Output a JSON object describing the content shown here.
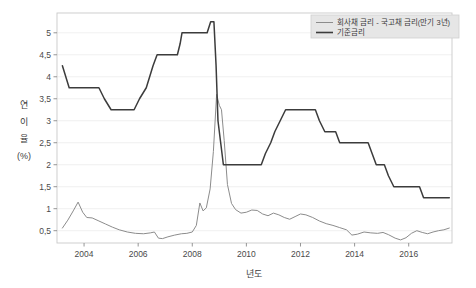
{
  "chart_data": {
    "type": "line",
    "title": "",
    "xlabel": "년도",
    "ylabel": "연 이율 (%)",
    "xlim": [
      2003.0,
      2017.6
    ],
    "ylim": [
      0.22,
      5.45
    ],
    "xticks": [
      2004,
      2006,
      2008,
      2010,
      2012,
      2014,
      2016
    ],
    "xtick_labels": [
      "2004",
      "2006",
      "2008",
      "2010",
      "2012",
      "2014",
      "2016"
    ],
    "yticks": [
      0.5,
      1,
      1.5,
      2,
      2.5,
      3,
      3.5,
      4,
      4.5,
      5
    ],
    "ytick_labels": [
      "0,5",
      "1",
      "1,5",
      "2",
      "2,5",
      "3",
      "3,5",
      "4",
      "4,5",
      "5"
    ],
    "grid": true,
    "legend_position": "upper right",
    "series": [
      {
        "name": "회사채 금리 - 국고채 금리(만기 3년)",
        "color": "#8c8c8c",
        "linewidth": 1.0,
        "points": [
          [
            2003.2,
            0.56
          ],
          [
            2003.4,
            0.74
          ],
          [
            2003.6,
            0.95
          ],
          [
            2003.78,
            1.15
          ],
          [
            2003.95,
            0.92
          ],
          [
            2004.1,
            0.8
          ],
          [
            2004.3,
            0.79
          ],
          [
            2004.55,
            0.72
          ],
          [
            2004.8,
            0.65
          ],
          [
            2005.05,
            0.58
          ],
          [
            2005.3,
            0.52
          ],
          [
            2005.6,
            0.47
          ],
          [
            2005.9,
            0.44
          ],
          [
            2006.2,
            0.43
          ],
          [
            2006.45,
            0.45
          ],
          [
            2006.6,
            0.47
          ],
          [
            2006.75,
            0.33
          ],
          [
            2006.9,
            0.32
          ],
          [
            2007.1,
            0.36
          ],
          [
            2007.35,
            0.4
          ],
          [
            2007.6,
            0.43
          ],
          [
            2007.8,
            0.44
          ],
          [
            2008.0,
            0.47
          ],
          [
            2008.15,
            0.62
          ],
          [
            2008.28,
            1.13
          ],
          [
            2008.4,
            0.95
          ],
          [
            2008.52,
            1.02
          ],
          [
            2008.66,
            1.45
          ],
          [
            2008.78,
            2.3
          ],
          [
            2008.9,
            3.6
          ],
          [
            2009.0,
            3.35
          ],
          [
            2009.08,
            3.25
          ],
          [
            2009.18,
            2.55
          ],
          [
            2009.3,
            1.55
          ],
          [
            2009.45,
            1.12
          ],
          [
            2009.6,
            0.98
          ],
          [
            2009.8,
            0.9
          ],
          [
            2010.0,
            0.92
          ],
          [
            2010.2,
            0.97
          ],
          [
            2010.4,
            0.96
          ],
          [
            2010.6,
            0.88
          ],
          [
            2010.8,
            0.84
          ],
          [
            2011.0,
            0.9
          ],
          [
            2011.2,
            0.86
          ],
          [
            2011.4,
            0.8
          ],
          [
            2011.6,
            0.76
          ],
          [
            2011.8,
            0.82
          ],
          [
            2012.0,
            0.88
          ],
          [
            2012.2,
            0.86
          ],
          [
            2012.45,
            0.8
          ],
          [
            2012.7,
            0.72
          ],
          [
            2012.95,
            0.66
          ],
          [
            2013.2,
            0.62
          ],
          [
            2013.45,
            0.57
          ],
          [
            2013.7,
            0.52
          ],
          [
            2013.9,
            0.4
          ],
          [
            2014.1,
            0.42
          ],
          [
            2014.35,
            0.47
          ],
          [
            2014.6,
            0.45
          ],
          [
            2014.85,
            0.44
          ],
          [
            2015.05,
            0.46
          ],
          [
            2015.25,
            0.41
          ],
          [
            2015.5,
            0.33
          ],
          [
            2015.7,
            0.29
          ],
          [
            2015.9,
            0.34
          ],
          [
            2016.1,
            0.44
          ],
          [
            2016.3,
            0.5
          ],
          [
            2016.5,
            0.46
          ],
          [
            2016.7,
            0.43
          ],
          [
            2016.9,
            0.47
          ],
          [
            2017.1,
            0.5
          ],
          [
            2017.3,
            0.52
          ],
          [
            2017.5,
            0.56
          ]
        ]
      },
      {
        "name": "기준금리",
        "color": "#3c3c3c",
        "linewidth": 1.5,
        "points": [
          [
            2003.2,
            4.25
          ],
          [
            2003.45,
            3.75
          ],
          [
            2004.55,
            3.75
          ],
          [
            2004.75,
            3.5
          ],
          [
            2005.0,
            3.25
          ],
          [
            2005.85,
            3.25
          ],
          [
            2006.05,
            3.5
          ],
          [
            2006.3,
            3.75
          ],
          [
            2006.55,
            4.25
          ],
          [
            2006.7,
            4.5
          ],
          [
            2007.45,
            4.5
          ],
          [
            2007.55,
            4.75
          ],
          [
            2007.62,
            5.0
          ],
          [
            2008.55,
            5.0
          ],
          [
            2008.68,
            5.25
          ],
          [
            2008.8,
            5.25
          ],
          [
            2008.88,
            4.25
          ],
          [
            2008.95,
            3.0
          ],
          [
            2009.05,
            2.5
          ],
          [
            2009.15,
            2.0
          ],
          [
            2010.55,
            2.0
          ],
          [
            2010.7,
            2.25
          ],
          [
            2010.9,
            2.5
          ],
          [
            2011.05,
            2.75
          ],
          [
            2011.25,
            3.0
          ],
          [
            2011.45,
            3.25
          ],
          [
            2012.55,
            3.25
          ],
          [
            2012.7,
            3.0
          ],
          [
            2012.9,
            2.75
          ],
          [
            2013.3,
            2.75
          ],
          [
            2013.45,
            2.5
          ],
          [
            2014.5,
            2.5
          ],
          [
            2014.65,
            2.25
          ],
          [
            2014.8,
            2.0
          ],
          [
            2015.1,
            2.0
          ],
          [
            2015.25,
            1.75
          ],
          [
            2015.45,
            1.5
          ],
          [
            2016.4,
            1.5
          ],
          [
            2016.55,
            1.25
          ],
          [
            2017.5,
            1.25
          ]
        ]
      }
    ]
  },
  "legend": {
    "items": [
      {
        "label": "회사채 금리 - 국고채 금리(만기 3년)",
        "color": "#8c8c8c"
      },
      {
        "label": "기준금리",
        "color": "#3c3c3c"
      }
    ]
  }
}
